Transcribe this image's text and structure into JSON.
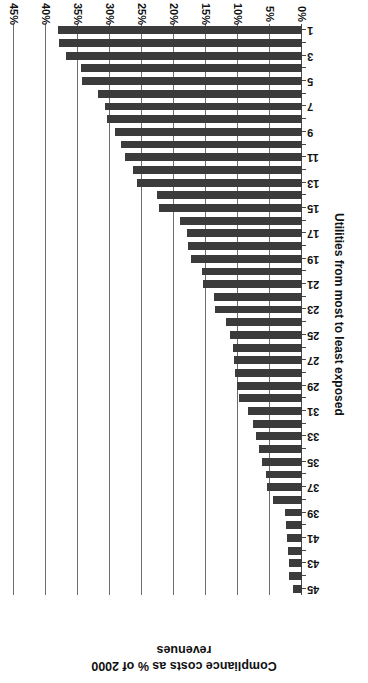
{
  "chart_data": {
    "type": "bar",
    "orientation": "horizontal",
    "title": "",
    "xlabel": "Utilities from most to least exposed",
    "ylabel": "Compliance costs as % of 2000 revenues",
    "ylabel_lines": [
      "Compliance costs as % of 2000",
      "revenues"
    ],
    "categories": [
      1,
      2,
      3,
      4,
      5,
      6,
      7,
      8,
      9,
      10,
      11,
      12,
      13,
      14,
      15,
      16,
      17,
      18,
      19,
      20,
      21,
      22,
      23,
      24,
      25,
      26,
      27,
      28,
      29,
      30,
      31,
      32,
      33,
      34,
      35,
      36,
      37,
      38,
      39,
      40,
      41,
      42,
      43,
      44,
      45
    ],
    "tick_labels_x": [
      "1",
      "3",
      "5",
      "7",
      "9",
      "11",
      "13",
      "15",
      "17",
      "19",
      "21",
      "23",
      "25",
      "27",
      "29",
      "31",
      "33",
      "35",
      "37",
      "39",
      "41",
      "43",
      "45"
    ],
    "tick_labels_y": [
      "0%",
      "5%",
      "10%",
      "15%",
      "20%",
      "25%",
      "30%",
      "35%",
      "40%",
      "45%"
    ],
    "tick_values_y": [
      0,
      5,
      10,
      15,
      20,
      25,
      30,
      35,
      40,
      45
    ],
    "ylim": [
      0,
      45
    ],
    "values": [
      38.2,
      38.0,
      36.8,
      34.6,
      34.4,
      31.8,
      30.8,
      30.4,
      29.2,
      28.3,
      27.6,
      26.4,
      25.8,
      22.6,
      22.4,
      19.0,
      18.0,
      17.8,
      17.4,
      15.6,
      15.4,
      13.8,
      13.6,
      11.9,
      11.2,
      10.8,
      10.6,
      10.4,
      10.2,
      9.8,
      8.4,
      7.6,
      7.2,
      6.7,
      6.2,
      5.6,
      5.4,
      4.5,
      2.6,
      2.5,
      2.4,
      2.2,
      2.1,
      2.0,
      1.4
    ],
    "grid": true,
    "gridline_axis": "value",
    "legend": "none",
    "bar_color": "#3b3b3b",
    "grid_color": "#6d6d6d",
    "background": "#ffffff",
    "rotation_note": "chart rendered rotated 180 degrees"
  },
  "axes": {
    "value_axis_title_line1": "Compliance costs as % of 2000",
    "value_axis_title_line2": "revenues",
    "category_axis_title": "Utilities from most to least exposed"
  }
}
